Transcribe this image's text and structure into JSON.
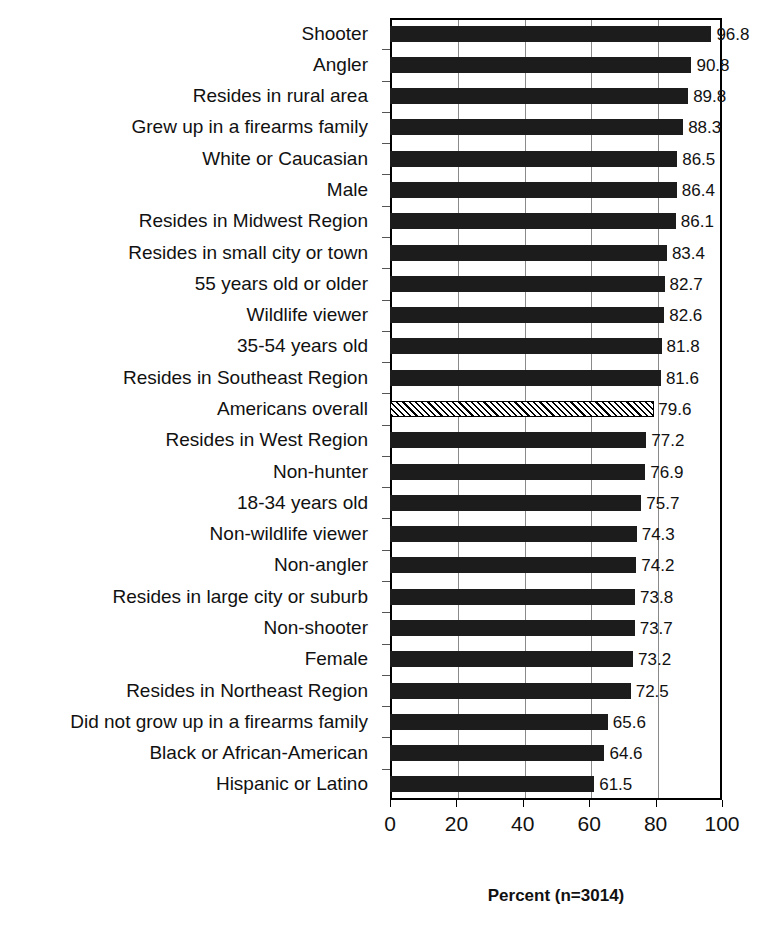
{
  "chart_data": {
    "type": "bar",
    "orientation": "horizontal",
    "title": "",
    "subtitle": "",
    "xlabel": "Percent (n=3014)",
    "ylabel": "",
    "xlim": [
      0,
      100
    ],
    "xticks": [
      0,
      20,
      40,
      60,
      80,
      100
    ],
    "grid": true,
    "grid_axis": "x",
    "legend": null,
    "categories": [
      "Shooter",
      "Angler",
      "Resides in rural area",
      "Grew up in a firearms family",
      "White or Caucasian",
      "Male",
      "Resides in Midwest Region",
      "Resides in small city or town",
      "55 years old or older",
      "Wildlife viewer",
      "35-54 years old",
      "Resides in Southeast Region",
      "Americans overall",
      "Resides in West Region",
      "Non-hunter",
      "18-34 years old",
      "Non-wildlife viewer",
      "Non-angler",
      "Resides in large city or suburb",
      "Non-shooter",
      "Female",
      "Resides in Northeast Region",
      "Did not grow up in a firearms family",
      "Black or African-American",
      "Hispanic or Latino"
    ],
    "values": [
      96.8,
      90.8,
      89.8,
      88.3,
      86.5,
      86.4,
      86.1,
      83.4,
      82.7,
      82.6,
      81.8,
      81.6,
      79.6,
      77.2,
      76.9,
      75.7,
      74.3,
      74.2,
      73.8,
      73.7,
      73.2,
      72.5,
      65.6,
      64.6,
      61.5
    ],
    "value_labels": [
      "96.8",
      "90.8",
      "89.8",
      "88.3",
      "86.5",
      "86.4",
      "86.1",
      "83.4",
      "82.7",
      "82.6",
      "81.8",
      "81.6",
      "79.6",
      "77.2",
      "76.9",
      "75.7",
      "74.3",
      "74.2",
      "73.8",
      "73.7",
      "73.2",
      "72.5",
      "65.6",
      "64.6",
      "61.5"
    ],
    "highlighted_category": "Americans overall",
    "highlight_style": "diagonal-hatch",
    "bar_color": "#1c1c1c",
    "highlight_color": "#ffffff",
    "grid_color": "#8a8a8a",
    "axis_color": "#000000"
  }
}
